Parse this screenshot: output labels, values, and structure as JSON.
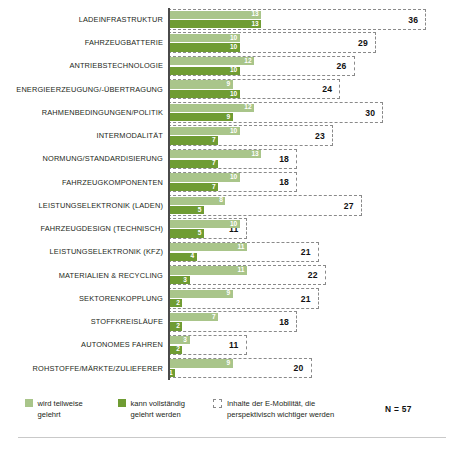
{
  "chart_data": {
    "type": "bar",
    "orientation": "horizontal",
    "title": "",
    "xlabel": "",
    "ylabel": "",
    "grid": false,
    "legend_position": "bottom",
    "xlim": [
      0,
      40
    ],
    "categories": [
      "LADEINFRASTRUKTUR",
      "FAHRZEUGBATTERIE",
      "ANTRIEBSTECHNOLOGIE",
      "ENERGIEERZEUGUNG/-ÜBERTRAGUNG",
      "RAHMENBEDINGUNGEN/POLITIK",
      "INTERMODALITÄT",
      "NORMUNG/STANDARDISIERUNG",
      "FAHRZEUGKOMPONENTEN",
      "LEISTUNGSELEKTRONIK (LADEN)",
      "FAHRZEUGDESIGN (TECHNISCH)",
      "LEISTUNGSELEKTRONIK (KFZ)",
      "MATERIALIEN & RECYCLING",
      "SEKTORENKOPPLUNG",
      "STOFFKREISLÄUFE",
      "AUTONOMES FAHREN",
      "ROHSTOFFE/MÄRKTE/ZULIEFERER"
    ],
    "series": [
      {
        "name": "wird teilweise gelehrt",
        "color": "#a9c58a",
        "values": [
          13,
          10,
          12,
          9,
          12,
          10,
          13,
          10,
          8,
          10,
          11,
          11,
          9,
          7,
          3,
          9
        ]
      },
      {
        "name": "kann vollständig gelehrt werden",
        "color": "#6f9c33",
        "values": [
          13,
          10,
          10,
          10,
          9,
          7,
          7,
          7,
          5,
          5,
          4,
          3,
          2,
          2,
          2,
          1
        ]
      },
      {
        "name": "Inhalte der E-Mobilität, die perspektivisch wichtiger werden",
        "color": "#8a8a8a",
        "style": "dashed-outline",
        "values": [
          36,
          29,
          26,
          24,
          30,
          23,
          18,
          18,
          27,
          11,
          21,
          22,
          21,
          18,
          11,
          20
        ]
      }
    ]
  },
  "legend": {
    "items": [
      {
        "icon": "light-green-square-icon",
        "label": "wird teilweise\ngelehrt"
      },
      {
        "icon": "dark-green-square-icon",
        "label": "kann vollständig\ngelehrt werden"
      },
      {
        "icon": "dashed-box-icon",
        "label": "Inhalte der E-Mobilität, die\nperspektivisch wichtiger werden"
      }
    ],
    "sample_size": "N = 57"
  },
  "colors": {
    "light_green": "#a9c58a",
    "dark_green": "#6f9c33",
    "dashed_gray": "#8a8a8a",
    "text": "#231f20",
    "axis": "#4a4a4a"
  }
}
